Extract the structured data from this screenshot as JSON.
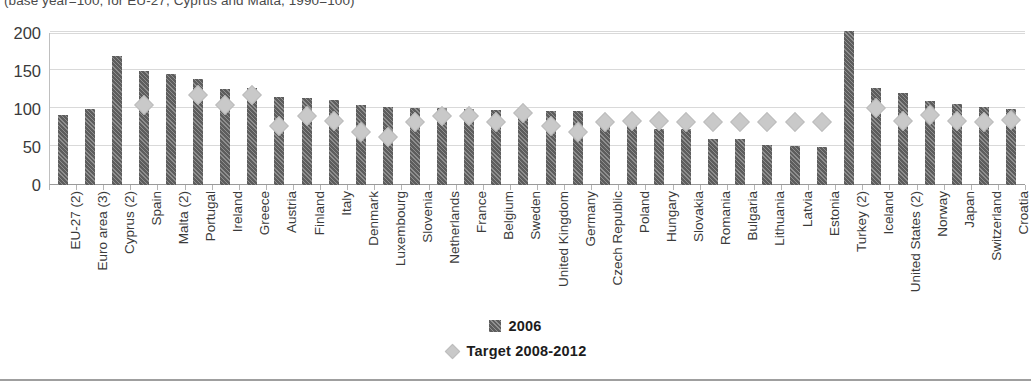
{
  "chart_data": {
    "type": "bar",
    "title": "(base year=100; for EU-27, Cyprus and Malta, 1990=100)",
    "xlabel": "",
    "ylabel": "",
    "ylim": [
      0,
      200
    ],
    "yticks": [
      0,
      50,
      100,
      150,
      200
    ],
    "ytick_labels": [
      "0",
      "50",
      "100",
      "150",
      "200"
    ],
    "grid": true,
    "legend_position": "bottom",
    "categories": [
      "EU-27 (2)",
      "Euro area (3)",
      "Cyprus (2)",
      "Spain",
      "Malta (2)",
      "Portugal",
      "Ireland",
      "Greece",
      "Austria",
      "Finland",
      "Italy",
      "Denmark",
      "Luxembourg",
      "Slovenia",
      "Netherlands",
      "France",
      "Belgium",
      "Sweden",
      "United Kingdom",
      "Germany",
      "Czech Republic",
      "Poland",
      "Hungary",
      "Slovakia",
      "Romania",
      "Bulgaria",
      "Lithuania",
      "Latvia",
      "Estonia",
      "Turkey (2)",
      "Iceland",
      "United States (2)",
      "Norway",
      "Japan",
      "Switzerland",
      "Croatia"
    ],
    "series": [
      {
        "name": "2006",
        "marker": "bar",
        "color": "#5d5d5d",
        "values": [
          92,
          100,
          170,
          150,
          146,
          140,
          126,
          127,
          116,
          114,
          112,
          105,
          102,
          101,
          101,
          100,
          99,
          95,
          98,
          98,
          76,
          78,
          74,
          74,
          61,
          60,
          53,
          51,
          50,
          202,
          128,
          121,
          111,
          106,
          102,
          100
        ]
      },
      {
        "name": "Target 2008-2012",
        "marker": "diamond",
        "color": "#c9c9c9",
        "values": [
          null,
          null,
          null,
          115,
          null,
          128,
          115,
          127,
          87,
          100,
          93,
          79,
          72,
          92,
          100,
          100,
          92,
          104,
          87,
          79,
          92,
          94,
          94,
          92,
          92,
          92,
          92,
          92,
          92,
          null,
          110,
          93,
          101,
          94,
          92,
          95
        ]
      }
    ]
  },
  "legend": {
    "items": [
      {
        "label": "2006",
        "icon": "hatched-square-icon"
      },
      {
        "label": "Target 2008-2012",
        "icon": "diamond-icon"
      }
    ]
  }
}
